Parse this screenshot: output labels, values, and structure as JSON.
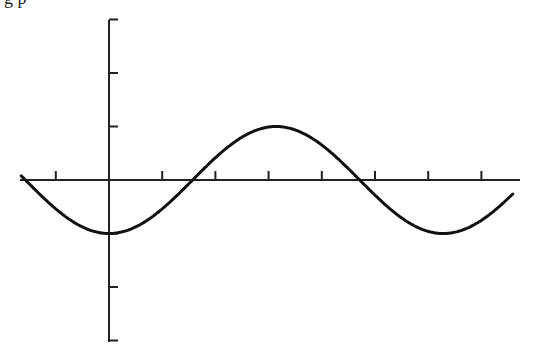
{
  "header": {
    "partial_text": "g p"
  },
  "chart_data": {
    "type": "line",
    "title": "",
    "xlabel": "",
    "ylabel": "",
    "function": "y = -cos(x)",
    "series": [
      {
        "name": "curve",
        "x": [
          -1.6,
          -1,
          0,
          1,
          1.57,
          2,
          3,
          3.14,
          4,
          4.71,
          5,
          6,
          6.28,
          7.5
        ],
        "values": [
          -0.03,
          -0.54,
          -1,
          -0.54,
          0,
          0.42,
          0.99,
          1,
          0.65,
          0,
          -0.28,
          -0.96,
          -1,
          -0.35
        ]
      }
    ],
    "xlim": [
      -1.6,
      7.7
    ],
    "ylim": [
      -3,
      3
    ],
    "x_ticks": [
      -1,
      1,
      2,
      3,
      4,
      5,
      6,
      7
    ],
    "y_ticks": [
      -3,
      -2,
      -1,
      1,
      2,
      3
    ],
    "grid": false,
    "tick_labels_shown": false,
    "colors": {
      "line": "#111111",
      "axes": "#222222"
    }
  }
}
